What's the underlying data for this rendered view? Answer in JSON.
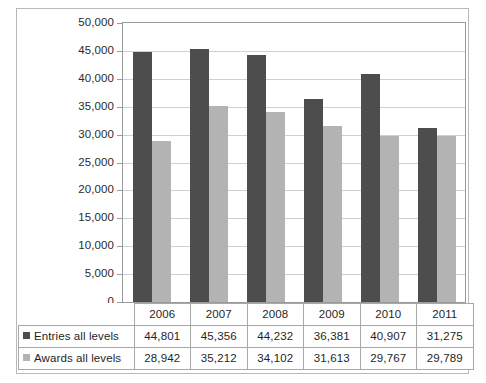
{
  "chart_data": {
    "type": "bar",
    "title": "",
    "xlabel": "",
    "ylabel": "",
    "categories": [
      "2006",
      "2007",
      "2008",
      "2009",
      "2010",
      "2011"
    ],
    "series": [
      {
        "name": "Entries all levels",
        "color": "#4d4d4d",
        "values": [
          44801,
          45356,
          44232,
          36381,
          40907,
          31275
        ],
        "value_labels": [
          "44,801",
          "45,356",
          "44,232",
          "36,381",
          "40,907",
          "31,275"
        ]
      },
      {
        "name": "Awards all levels",
        "color": "#b3b3b3",
        "values": [
          28942,
          35212,
          34102,
          31613,
          29767,
          29789
        ],
        "value_labels": [
          "28,942",
          "35,212",
          "34,102",
          "31,613",
          "29,767",
          "29,789"
        ]
      }
    ],
    "ylim": [
      0,
      50000
    ],
    "ytick_step": 5000,
    "ytick_labels": [
      "50,000",
      "45,000",
      "40,000",
      "35,000",
      "30,000",
      "25,000",
      "20,000",
      "15,000",
      "10,000",
      "5,000",
      "0"
    ],
    "ytick_values": [
      50000,
      45000,
      40000,
      35000,
      30000,
      25000,
      20000,
      15000,
      10000,
      5000,
      0
    ],
    "grid": true,
    "legend_position": "data-table"
  },
  "table": {
    "header_row": [
      "",
      "2006",
      "2007",
      "2008",
      "2009",
      "2010",
      "2011"
    ],
    "rows": [
      {
        "label": "Entries all levels",
        "swatch": "entries-swatch",
        "cells": [
          "44,801",
          "45,356",
          "44,232",
          "36,381",
          "40,907",
          "31,275"
        ]
      },
      {
        "label": "Awards all levels",
        "swatch": "awards-swatch",
        "cells": [
          "28,942",
          "35,212",
          "34,102",
          "31,613",
          "29,767",
          "29,789"
        ]
      }
    ]
  },
  "colors": {
    "entries": "#4d4d4d",
    "awards": "#b3b3b3",
    "gridline": "#cfcfcf",
    "axis": "#9a9a9a",
    "border": "#a8a8a8",
    "text": "#1f1f1f",
    "background": "#ffffff"
  }
}
